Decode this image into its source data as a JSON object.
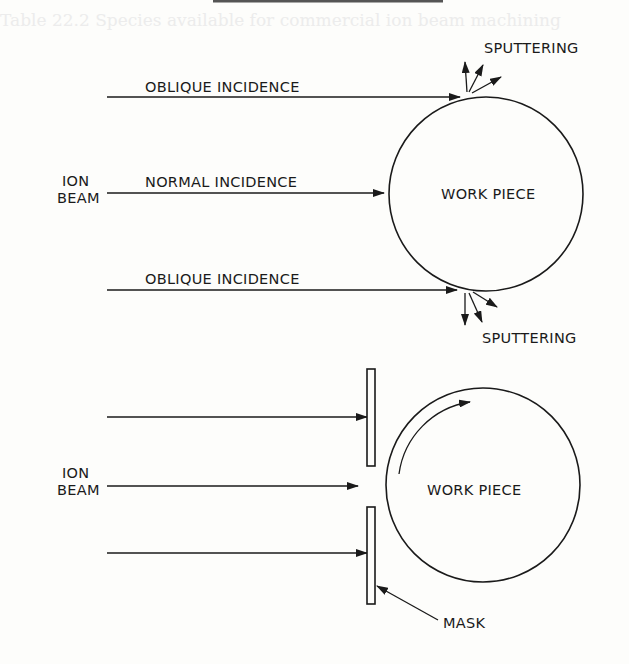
{
  "ghost_header": "Table 22.2 Species available for commercial ion beam machining",
  "colors": {
    "ink": "#1a1a1a",
    "paper": "#fdfdfb",
    "ghost": "#ececec"
  },
  "top_diagram": {
    "ion_beam_label": [
      "ION",
      "BEAM"
    ],
    "oblique_top_label": "OBLIQUE INCIDENCE",
    "normal_label": "NORMAL INCIDENCE",
    "oblique_bottom_label": "OBLIQUE INCIDENCE",
    "workpiece_label": "WORK PIECE",
    "sputter_top_label": "SPUTTERING",
    "sputter_bottom_label": "SPUTTERING"
  },
  "bottom_diagram": {
    "ion_beam_label": [
      "ION",
      "BEAM"
    ],
    "workpiece_label": "WORK PIECE",
    "mask_label": "MASK",
    "rotation_indicator": "rotation-arrow"
  }
}
